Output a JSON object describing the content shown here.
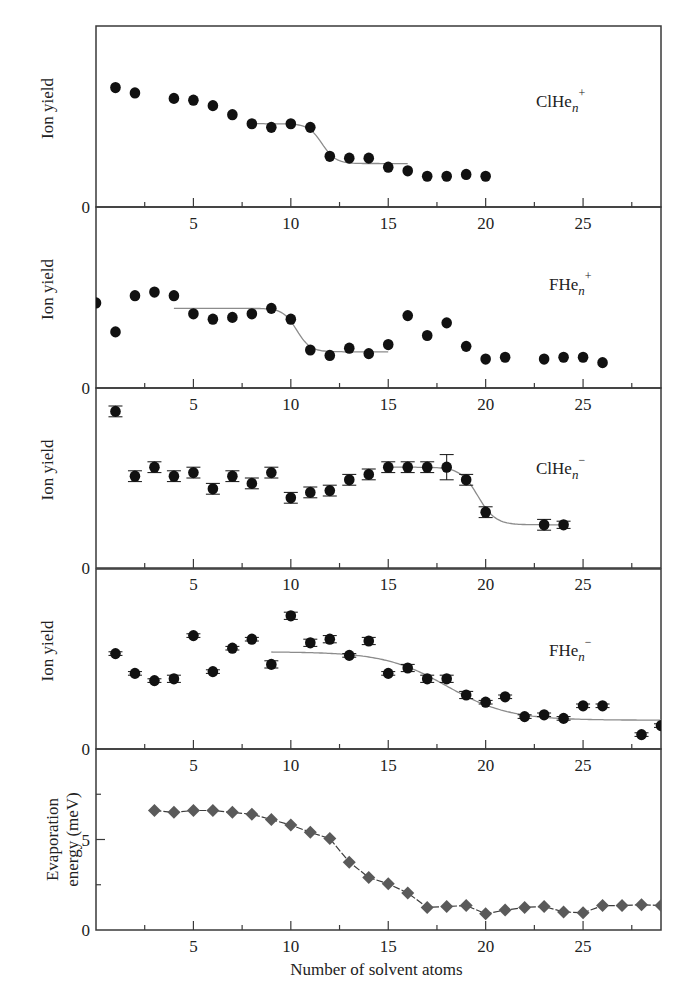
{
  "figure": {
    "xlabel": "Number of solvent atoms",
    "x_range": [
      0,
      29
    ],
    "x_major_ticks": [
      5,
      10,
      15,
      20,
      25
    ],
    "x_minor_ticks": [
      2.5,
      7.5,
      12.5,
      17.5,
      22.5,
      27.5
    ]
  },
  "chart_data": [
    {
      "type": "scatter",
      "title": "",
      "series_label": {
        "base": "ClHe",
        "sub": "n",
        "sup": "+"
      },
      "xlabel": "",
      "ylabel": "Ion yield",
      "ylim": [
        0,
        100
      ],
      "y_ticks": [
        {
          "value": 0,
          "label": "0"
        }
      ],
      "marker": "circle",
      "error_bars": false,
      "points": [
        [
          1,
          66
        ],
        [
          2,
          63
        ],
        [
          4,
          60
        ],
        [
          5,
          59
        ],
        [
          6,
          56
        ],
        [
          7,
          51
        ],
        [
          8,
          46
        ],
        [
          9,
          44
        ],
        [
          10,
          46
        ],
        [
          11,
          44
        ],
        [
          12,
          28
        ],
        [
          13,
          27
        ],
        [
          14,
          27
        ],
        [
          15,
          22
        ],
        [
          16,
          20
        ],
        [
          17,
          17
        ],
        [
          18,
          17
        ],
        [
          19,
          18
        ],
        [
          20,
          17
        ]
      ],
      "fit": {
        "x_start": 8,
        "x_end": 16,
        "high": 46,
        "low": 24,
        "center": 11.6,
        "width": 0.35
      }
    },
    {
      "type": "scatter",
      "title": "",
      "series_label": {
        "base": "FHe",
        "sub": "n",
        "sup": "+"
      },
      "xlabel": "",
      "ylabel": "Ion yield",
      "ylim": [
        0,
        100
      ],
      "y_ticks": [
        {
          "value": 0,
          "label": "0"
        }
      ],
      "marker": "circle",
      "error_bars": false,
      "points": [
        [
          0,
          47
        ],
        [
          1,
          31
        ],
        [
          2,
          51
        ],
        [
          3,
          53
        ],
        [
          4,
          51
        ],
        [
          5,
          41
        ],
        [
          6,
          38
        ],
        [
          7,
          39
        ],
        [
          8,
          41
        ],
        [
          9,
          44
        ],
        [
          10,
          38
        ],
        [
          11,
          21
        ],
        [
          12,
          18
        ],
        [
          13,
          22
        ],
        [
          14,
          19
        ],
        [
          15,
          24
        ],
        [
          16,
          40
        ],
        [
          17,
          29
        ],
        [
          18,
          36
        ],
        [
          19,
          23
        ],
        [
          20,
          16
        ],
        [
          21,
          17
        ],
        [
          23,
          16
        ],
        [
          24,
          17
        ],
        [
          25,
          17
        ],
        [
          26,
          14
        ]
      ],
      "fit": {
        "x_start": 4,
        "x_end": 15,
        "high": 44,
        "low": 20,
        "center": 10.3,
        "width": 0.35
      }
    },
    {
      "type": "scatter",
      "title": "",
      "series_label": {
        "base": "ClHe",
        "sub": "n",
        "sup": "−"
      },
      "xlabel": "",
      "ylabel": "Ion yield",
      "ylim": [
        0,
        100
      ],
      "y_ticks": [
        {
          "value": 0,
          "label": "0"
        }
      ],
      "marker": "circle",
      "error_bars": true,
      "points": [
        [
          1,
          87,
          3
        ],
        [
          2,
          51,
          3
        ],
        [
          3,
          56,
          3
        ],
        [
          4,
          51,
          3
        ],
        [
          5,
          53,
          3
        ],
        [
          6,
          44,
          3
        ],
        [
          7,
          51,
          3
        ],
        [
          8,
          47,
          3
        ],
        [
          9,
          53,
          3
        ],
        [
          10,
          39,
          3
        ],
        [
          11,
          42,
          3
        ],
        [
          12,
          43,
          3
        ],
        [
          13,
          49,
          3
        ],
        [
          14,
          52,
          3
        ],
        [
          15,
          56,
          3
        ],
        [
          16,
          56,
          3
        ],
        [
          17,
          56,
          3
        ],
        [
          18,
          56,
          7
        ],
        [
          19,
          49,
          3
        ],
        [
          20,
          31,
          3
        ],
        [
          23,
          24,
          3
        ],
        [
          24,
          24,
          2
        ]
      ],
      "fit": {
        "x_start": 15,
        "x_end": 24,
        "high": 56,
        "low": 24,
        "center": 19.6,
        "width": 0.45
      }
    },
    {
      "type": "scatter",
      "title": "",
      "series_label": {
        "base": "FHe",
        "sub": "n",
        "sup": "−"
      },
      "xlabel": "",
      "ylabel": "Ion yield",
      "ylim": [
        0,
        100
      ],
      "y_ticks": [
        {
          "value": 0,
          "label": "0"
        }
      ],
      "marker": "circle",
      "error_bars": true,
      "points": [
        [
          1,
          53,
          1
        ],
        [
          2,
          42,
          1
        ],
        [
          3,
          38,
          1
        ],
        [
          4,
          39,
          2
        ],
        [
          5,
          63,
          1
        ],
        [
          6,
          43,
          1
        ],
        [
          7,
          56,
          1
        ],
        [
          8,
          61,
          1
        ],
        [
          9,
          47,
          2
        ],
        [
          10,
          74,
          2
        ],
        [
          11,
          59,
          2
        ],
        [
          12,
          61,
          2
        ],
        [
          13,
          52,
          1
        ],
        [
          14,
          60,
          2
        ],
        [
          15,
          42,
          1
        ],
        [
          16,
          45,
          2
        ],
        [
          17,
          39,
          2
        ],
        [
          18,
          39,
          2
        ],
        [
          19,
          30,
          2
        ],
        [
          20,
          26,
          1
        ],
        [
          21,
          29,
          1
        ],
        [
          22,
          18,
          1
        ],
        [
          23,
          19,
          1
        ],
        [
          24,
          17,
          1
        ],
        [
          25,
          24,
          1
        ],
        [
          26,
          24,
          1
        ],
        [
          28,
          8,
          1
        ],
        [
          29,
          13,
          1
        ]
      ],
      "fit": {
        "x_start": 9,
        "x_end": 29,
        "high": 54,
        "low": 16,
        "center": 18.0,
        "width": 1.6
      }
    },
    {
      "type": "line",
      "title": "",
      "series_label": null,
      "xlabel": "Number of solvent atoms",
      "ylabel": "Evaporation energy (meV)",
      "ylabel_lines": [
        "Evaporation",
        "energy (meV)"
      ],
      "ylim": [
        0,
        10
      ],
      "y_ticks": [
        {
          "value": 0,
          "label": "0"
        },
        {
          "value": 5,
          "label": "5"
        }
      ],
      "y_minor_ticks": [
        2.5,
        7.5
      ],
      "marker": "diamond",
      "error_bars": false,
      "x": [
        3,
        4,
        5,
        6,
        7,
        8,
        9,
        10,
        11,
        12,
        13,
        14,
        15,
        16,
        17,
        18,
        19,
        20,
        21,
        22,
        23,
        24,
        25,
        26,
        27,
        28,
        29
      ],
      "values": [
        6.6,
        6.5,
        6.6,
        6.6,
        6.5,
        6.4,
        6.1,
        5.8,
        5.4,
        5.05,
        3.75,
        2.9,
        2.55,
        2.05,
        1.25,
        1.3,
        1.35,
        0.9,
        1.1,
        1.25,
        1.3,
        1.0,
        0.95,
        1.35,
        1.35,
        1.4,
        1.35
      ]
    }
  ],
  "colors": {
    "axis": "#3a3a3a",
    "marker": "#111111",
    "fit_line": "#8c8c8c",
    "diamond": "#5a5a5a",
    "diamond_line": "#3d3d3d"
  }
}
